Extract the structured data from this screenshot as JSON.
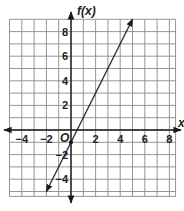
{
  "chart_data": {
    "type": "line",
    "title": "",
    "xlabel": "x",
    "ylabel": "f(x)",
    "origin_label": "O",
    "xlim": [
      -5,
      8.5
    ],
    "ylim": [
      -5.4,
      9
    ],
    "grid": true,
    "x_ticks": [
      -4,
      -2,
      2,
      4,
      6,
      8
    ],
    "y_ticks": [
      -4,
      -2,
      2,
      4,
      6,
      8
    ],
    "x_tick_labels": [
      "−4",
      "−2",
      "2",
      "4",
      "6",
      "8"
    ],
    "y_tick_labels": [
      "−4",
      "−2",
      "2",
      "4",
      "6",
      "8"
    ],
    "series": [
      {
        "name": "f(x) = 2x - 1",
        "slope": 2,
        "intercept": -1,
        "x": [
          -2,
          0,
          5
        ],
        "y": [
          -5,
          -1,
          9
        ],
        "arrows_both_ends": true,
        "marked_point": [
          0,
          -1
        ]
      }
    ]
  }
}
